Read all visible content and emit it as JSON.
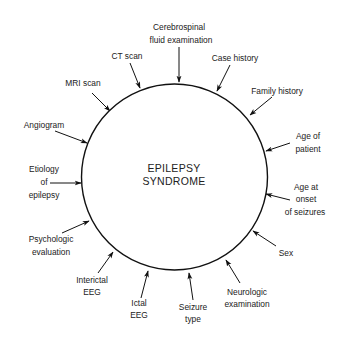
{
  "diagram": {
    "center_label": [
      "EPILEPSY",
      "SYNDROME"
    ],
    "circle": {
      "cx": 174.5,
      "cy": 177,
      "r": 93,
      "stroke": "#111111"
    },
    "inputs": [
      {
        "id": "csf",
        "lines": [
          "Cerebrospinal",
          "fluid examination"
        ]
      },
      {
        "id": "case-history",
        "lines": [
          "Case history"
        ]
      },
      {
        "id": "family-history",
        "lines": [
          "Family history"
        ]
      },
      {
        "id": "age-of-patient",
        "lines": [
          "Age of",
          "patient"
        ]
      },
      {
        "id": "age-at-onset",
        "lines": [
          "Age at",
          "onset",
          "of seizures"
        ]
      },
      {
        "id": "sex",
        "lines": [
          "Sex"
        ]
      },
      {
        "id": "neurologic-exam",
        "lines": [
          "Neurologic",
          "examination"
        ]
      },
      {
        "id": "seizure-type",
        "lines": [
          "Seizure",
          "type"
        ]
      },
      {
        "id": "ictal-eeg",
        "lines": [
          "Ictal",
          "EEG"
        ]
      },
      {
        "id": "interictal-eeg",
        "lines": [
          "Interictal",
          "EEG"
        ]
      },
      {
        "id": "psychologic-evaluation",
        "lines": [
          "Psychologic",
          "evaluation"
        ]
      },
      {
        "id": "etiology",
        "lines": [
          "Etiology",
          "of",
          "epilepsy"
        ]
      },
      {
        "id": "angiogram",
        "lines": [
          "Angiogram"
        ]
      },
      {
        "id": "mri-scan",
        "lines": [
          "MRI scan"
        ]
      },
      {
        "id": "ct-scan",
        "lines": [
          "CT scan"
        ]
      }
    ]
  }
}
